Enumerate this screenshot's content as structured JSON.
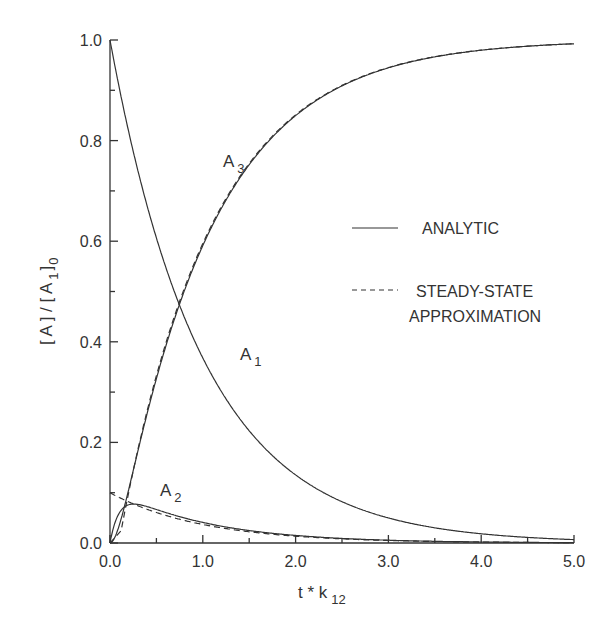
{
  "chart_data": {
    "type": "line",
    "title": "",
    "xlabel": "t * k",
    "xlabel_sub": "12",
    "ylabel": "[ A ] / [ A",
    "ylabel_sub1": "1",
    "ylabel_close": "]",
    "ylabel_sub0": "0",
    "xlim": [
      0,
      5
    ],
    "ylim": [
      0,
      1
    ],
    "x_ticks": [
      "0.0",
      "1.0",
      "2.0",
      "3.0",
      "4.0",
      "5.0"
    ],
    "y_ticks": [
      "0.0",
      "0.2",
      "0.4",
      "0.6",
      "0.8",
      "1.0"
    ],
    "grid": false,
    "legend": [
      {
        "label": "ANALYTIC",
        "style": "solid"
      },
      {
        "label": "STEADY-STATE",
        "label2": "APPROXIMATION",
        "style": "dashed"
      }
    ],
    "annotations": [
      {
        "text": "A",
        "sub": "1",
        "x": 1.4,
        "y": 0.4
      },
      {
        "text": "A",
        "sub": "2",
        "x": 0.5,
        "y": 0.09
      },
      {
        "text": "A",
        "sub": "3",
        "x": 0.6,
        "y": 0.83
      }
    ],
    "x": [
      0,
      0.05,
      0.1,
      0.2,
      0.3,
      0.5,
      0.75,
      1.0,
      1.5,
      2.0,
      2.5,
      3.0,
      3.5,
      4.0,
      4.5,
      5.0
    ],
    "series": [
      {
        "name": "A1 analytic",
        "style": "solid",
        "values": [
          1.0,
          0.951,
          0.905,
          0.819,
          0.741,
          0.607,
          0.472,
          0.368,
          0.223,
          0.135,
          0.082,
          0.05,
          0.03,
          0.018,
          0.011,
          0.007
        ]
      },
      {
        "name": "A2 analytic",
        "style": "solid",
        "values": [
          0.0,
          0.044,
          0.065,
          0.076,
          0.077,
          0.067,
          0.052,
          0.041,
          0.025,
          0.015,
          0.009,
          0.006,
          0.003,
          0.002,
          0.001,
          0.001
        ]
      },
      {
        "name": "A3 analytic",
        "style": "solid",
        "values": [
          0.0,
          0.005,
          0.03,
          0.105,
          0.182,
          0.326,
          0.476,
          0.591,
          0.752,
          0.85,
          0.909,
          0.944,
          0.967,
          0.98,
          0.988,
          0.992
        ]
      },
      {
        "name": "A2 steady-state",
        "style": "dashed",
        "values": [
          0.1,
          0.095,
          0.09,
          0.082,
          0.074,
          0.061,
          0.047,
          0.037,
          0.022,
          0.014,
          0.008,
          0.005,
          0.003,
          0.002,
          0.001,
          0.001
        ]
      },
      {
        "name": "A3 steady-state",
        "style": "dashed",
        "values": [
          0.0,
          0.054,
          0.095,
          0.099,
          0.185,
          0.332,
          0.481,
          0.595,
          0.755,
          0.851,
          0.91,
          0.945,
          0.967,
          0.98,
          0.988,
          0.992
        ]
      }
    ]
  }
}
